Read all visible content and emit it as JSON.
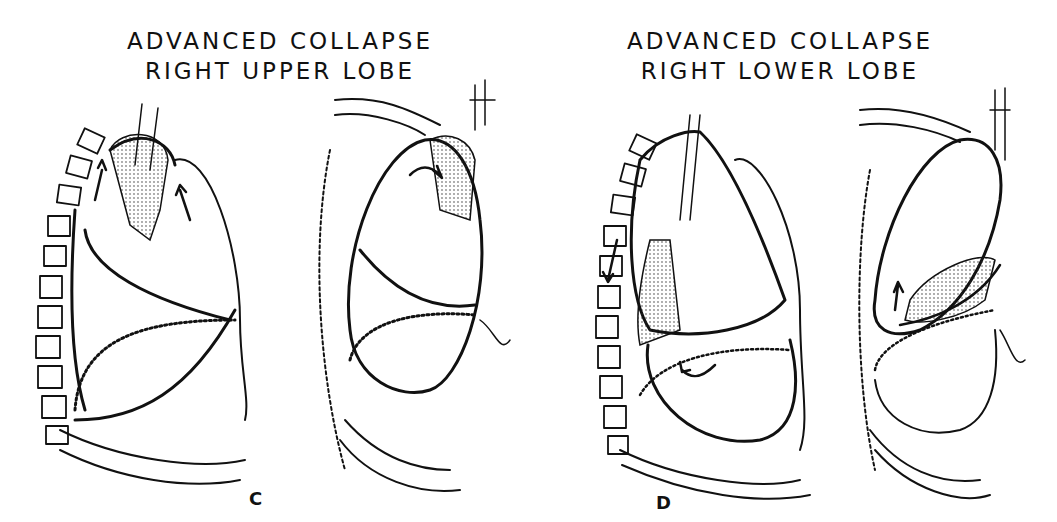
{
  "panels": [
    {
      "id": "C",
      "title_line1": "ADVANCED  COLLAPSE",
      "title_line2": "RIGHT UPPER LOBE",
      "label": "C"
    },
    {
      "id": "D",
      "title_line1": "ADVANCED  COLLAPSE",
      "title_line2": "RIGHT LOWER LOBE",
      "label": "D"
    }
  ],
  "colors": {
    "ink": "#111111",
    "background": "#ffffff"
  }
}
